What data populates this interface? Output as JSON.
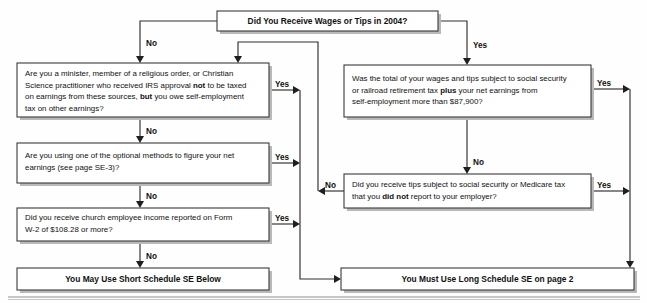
{
  "diagram": {
    "year": "2004",
    "nodes": {
      "start": {
        "id": "start",
        "label": "Did You Receive Wages or Tips in 2004?",
        "kind": "decision",
        "x": 217,
        "y": 11,
        "w": 221,
        "h": 20
      },
      "minister": {
        "id": "minister",
        "kind": "decision",
        "x": 17,
        "y": 63,
        "w": 252,
        "h": 54,
        "lines": [
          [
            {
              "t": "Are you a minister, member of a religious order, or Christian"
            }
          ],
          [
            {
              "t": "Science practitioner who received IRS approval "
            },
            {
              "t": "not",
              "b": true
            },
            {
              "t": " to be taxed"
            }
          ],
          [
            {
              "t": "on earnings from these sources, "
            },
            {
              "t": "but",
              "b": true
            },
            {
              "t": " you owe self-employment"
            }
          ],
          [
            {
              "t": "tax on other earnings?"
            }
          ]
        ]
      },
      "optional_methods": {
        "id": "optional_methods",
        "kind": "decision",
        "x": 17,
        "y": 143,
        "w": 252,
        "h": 40,
        "lines": [
          [
            {
              "t": "Are you using one of the optional methods to figure your net"
            }
          ],
          [
            {
              "t": "earnings (see page SE-3)?"
            }
          ]
        ]
      },
      "church_income": {
        "id": "church_income",
        "kind": "decision",
        "x": 17,
        "y": 208,
        "w": 252,
        "h": 33,
        "lines": [
          [
            {
              "t": "Did you receive church employee income reported on Form"
            }
          ],
          [
            {
              "t": "W-2 of $108.28 or more?"
            }
          ]
        ]
      },
      "short_se": {
        "id": "short_se",
        "kind": "terminal",
        "label": "You May Use Short Schedule SE Below",
        "x": 17,
        "y": 268,
        "w": 252,
        "h": 22
      },
      "wages_total": {
        "id": "wages_total",
        "kind": "decision",
        "x": 344,
        "y": 65,
        "w": 247,
        "h": 52,
        "lines": [
          [
            {
              "t": "Was the total of your wages and tips subject to social security"
            }
          ],
          [
            {
              "t": "or railroad retirement tax "
            },
            {
              "t": "plus",
              "b": true
            },
            {
              "t": " your net earnings from"
            }
          ],
          [
            {
              "t": "self-employment more than $87,900?"
            }
          ]
        ]
      },
      "unreported_tips": {
        "id": "unreported_tips",
        "kind": "decision",
        "x": 344,
        "y": 174,
        "w": 247,
        "h": 34,
        "lines": [
          [
            {
              "t": "Did you receive tips subject to social security or Medicare tax"
            }
          ],
          [
            {
              "t": "that you "
            },
            {
              "t": "did not",
              "b": true
            },
            {
              "t": " report to your employer?"
            }
          ]
        ]
      },
      "long_se": {
        "id": "long_se",
        "kind": "terminal",
        "label": "You Must Use Long Schedule SE on page 2",
        "x": 341,
        "y": 268,
        "w": 293,
        "h": 22
      }
    },
    "edge_labels": {
      "start_no": "No",
      "start_yes": "Yes",
      "minister_no": "No",
      "minister_yes": "Yes",
      "optional_no": "No",
      "optional_yes": "Yes",
      "church_no": "No",
      "church_yes": "Yes",
      "wages_no": "No",
      "wages_yes": "Yes",
      "tips_no": "No",
      "tips_yes": "Yes"
    },
    "colors": {
      "line": "#2e2e2e",
      "box_stroke": "#3a3a3a",
      "box_fill": "#ffffff",
      "shadow": "#b9b9b9",
      "text": "#111111",
      "background": "#fefefe"
    }
  }
}
